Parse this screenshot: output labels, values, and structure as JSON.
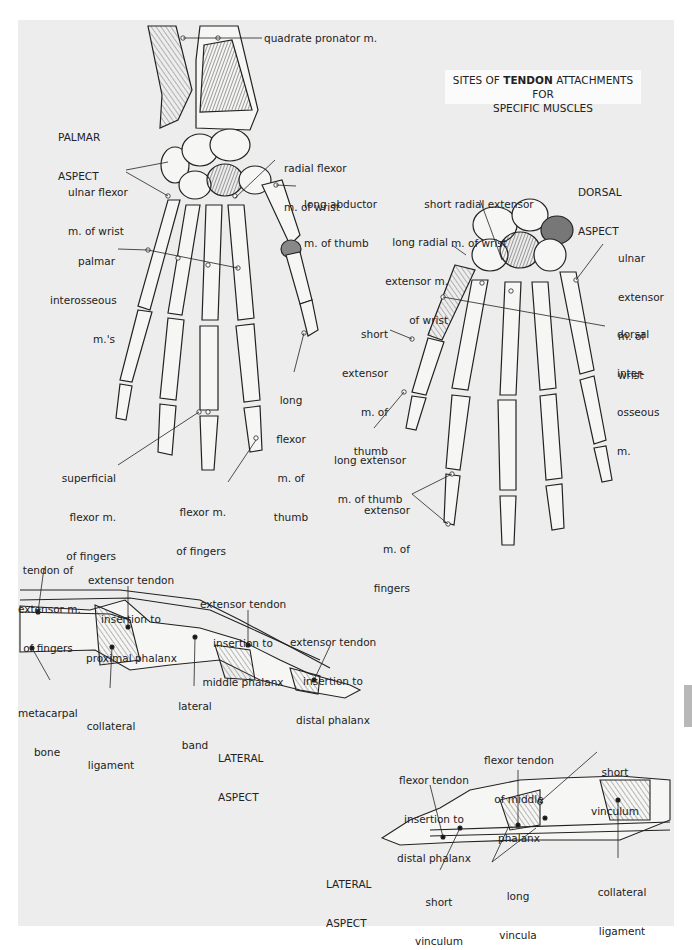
{
  "title": {
    "prefix": "SITES OF ",
    "emphasis": "TENDON",
    "suffix": " ATTACHMENTS FOR",
    "line2": "SPECIFIC MUSCLES"
  },
  "palmar": {
    "aspect_line1": "PALMAR",
    "aspect_line2": "ASPECT",
    "labels": {
      "quadrate_pronator": "quadrate pronator m.",
      "radial_flexor_1": "radial flexor",
      "radial_flexor_2": "m. of wrist",
      "ulnar_flexor_1": "ulnar flexor",
      "ulnar_flexor_2": "m. of wrist",
      "long_abductor_1": "long abductor",
      "long_abductor_2": "m. of thumb",
      "palmar_interosseous_1": "palmar",
      "palmar_interosseous_2": "interosseous",
      "palmar_interosseous_3": "m.'s",
      "long_flexor_thumb_1": "long",
      "long_flexor_thumb_2": "flexor",
      "long_flexor_thumb_3": "m. of",
      "long_flexor_thumb_4": "thumb",
      "superficial_flexor_1": "superficial",
      "superficial_flexor_2": "flexor m.",
      "superficial_flexor_3": "of fingers",
      "flexor_fingers_1": "flexor m.",
      "flexor_fingers_2": "of fingers"
    }
  },
  "dorsal": {
    "aspect_line1": "DORSAL",
    "aspect_line2": "ASPECT",
    "labels": {
      "short_radial_ext_1": "short radial extensor",
      "short_radial_ext_2": "m. of wrist",
      "long_radial_ext_1": "long radial",
      "long_radial_ext_2": "extensor m.",
      "long_radial_ext_3": "of wrist",
      "ulnar_ext_1": "ulnar",
      "ulnar_ext_2": "extensor",
      "ulnar_ext_3": "m. of",
      "ulnar_ext_4": "wrist",
      "short_ext_thumb_1": "short",
      "short_ext_thumb_2": "extensor",
      "short_ext_thumb_3": "m. of",
      "short_ext_thumb_4": "thumb",
      "dorsal_inter_1": "dorsal",
      "dorsal_inter_2": "inter-",
      "dorsal_inter_3": "osseous",
      "dorsal_inter_4": "m.",
      "long_ext_thumb_1": "long extensor",
      "long_ext_thumb_2": "m. of thumb",
      "ext_fingers_1": "extensor",
      "ext_fingers_2": "m. of",
      "ext_fingers_3": "fingers"
    }
  },
  "lateral_extensor": {
    "aspect_line1": "LATERAL",
    "aspect_line2": "ASPECT",
    "labels": {
      "tendon_ext_1": "tendon of",
      "tendon_ext_2": "extensor m.",
      "tendon_ext_3": "of fingers",
      "ext_prox_1": "extensor tendon",
      "ext_prox_2": "insertion to",
      "ext_prox_3": "proximal phalanx",
      "ext_mid_1": "extensor tendon",
      "ext_mid_2": "insertion to",
      "ext_mid_3": "middle phalanx",
      "ext_dist_1": "extensor tendon",
      "ext_dist_2": "insertion to",
      "ext_dist_3": "distal phalanx",
      "metacarpal_1": "metacarpal",
      "metacarpal_2": "bone",
      "collateral_1": "collateral",
      "collateral_2": "ligament",
      "lateral_band_1": "lateral",
      "lateral_band_2": "band"
    }
  },
  "lateral_flexor": {
    "aspect_line1": "LATERAL",
    "aspect_line2": "ASPECT",
    "labels": {
      "flex_mid_1": "flexor tendon",
      "flex_mid_2": "of middle",
      "flex_mid_3": "phalanx",
      "short_vinc_top_1": "short",
      "short_vinc_top_2": "vinculum",
      "flex_dist_1": "flexor tendon",
      "flex_dist_2": "insertion to",
      "flex_dist_3": "distal phalanx",
      "short_vinc_bot_1": "short",
      "short_vinc_bot_2": "vinculum",
      "long_vinc_1": "long",
      "long_vinc_2": "vincula",
      "collateral_1": "collateral",
      "collateral_2": "ligament"
    }
  },
  "colors": {
    "panel": "#ededed",
    "ink": "#222222",
    "title_box": "#fbfbfb",
    "thumb_tab": "#b8b8b8"
  }
}
